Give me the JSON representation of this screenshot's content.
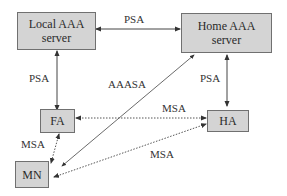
{
  "diagram": {
    "nodes": [
      {
        "id": "local",
        "label_line1": "Local AAA",
        "label_line2": "server"
      },
      {
        "id": "home",
        "label_line1": "Home AAA",
        "label_line2": "server"
      },
      {
        "id": "fa",
        "label": "FA"
      },
      {
        "id": "ha",
        "label": "HA"
      },
      {
        "id": "mn",
        "label": "MN"
      }
    ],
    "edges": [
      {
        "from": "local",
        "to": "home",
        "label": "PSA",
        "style": "solid",
        "arrows": "both"
      },
      {
        "from": "local",
        "to": "fa",
        "label": "PSA",
        "style": "solid",
        "arrows": "both"
      },
      {
        "from": "home",
        "to": "ha",
        "label": "PSA",
        "style": "solid",
        "arrows": "both"
      },
      {
        "from": "mn",
        "to": "home",
        "label": "AAASA",
        "style": "solid",
        "arrows": "both"
      },
      {
        "from": "fa",
        "to": "ha",
        "label": "MSA",
        "style": "dotted",
        "arrows": "both"
      },
      {
        "from": "fa",
        "to": "mn",
        "label": "MSA",
        "style": "dotted",
        "arrows": "both"
      },
      {
        "from": "mn",
        "to": "ha",
        "label": "MSA",
        "style": "dotted",
        "arrows": "both"
      }
    ]
  },
  "labels": {
    "psa_top": "PSA",
    "psa_left": "PSA",
    "psa_right": "PSA",
    "aaasa": "AAASA",
    "msa_fa_ha": "MSA",
    "msa_fa_mn": "MSA",
    "msa_mn_ha": "MSA"
  }
}
